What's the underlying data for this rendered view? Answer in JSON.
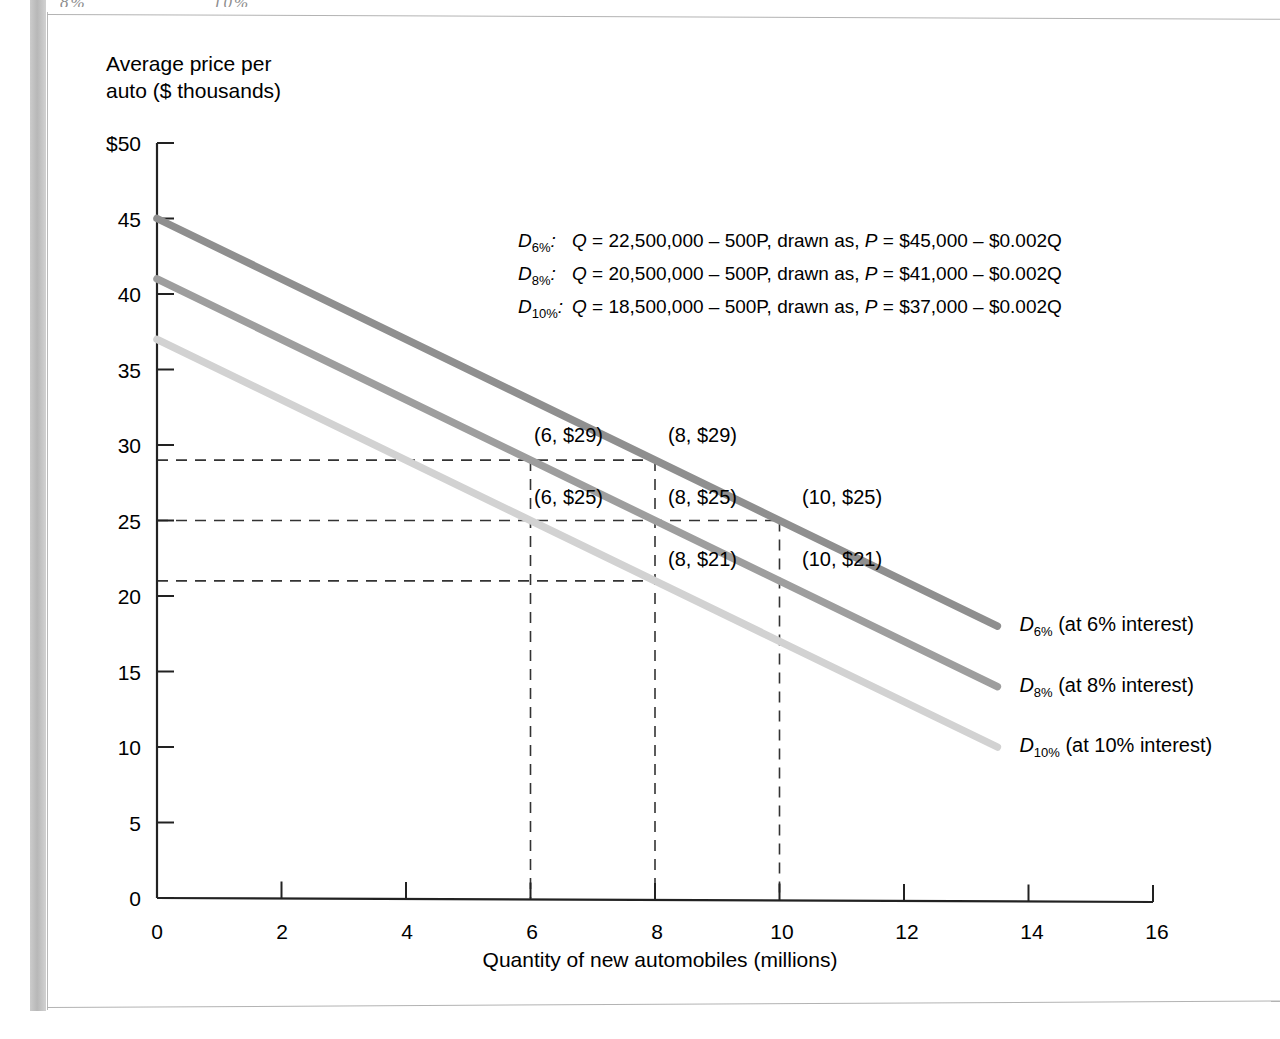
{
  "figure": {
    "y_axis_title": "Average price per\nauto ($ thousands)",
    "x_axis_title": "Quantity of new automobiles (millions)",
    "top_crop_fragments": [
      "8%",
      "10%"
    ]
  },
  "chart_data": {
    "type": "line",
    "title": "",
    "xlabel": "Quantity of new automobiles (millions)",
    "ylabel": "Average price per auto ($ thousands)",
    "xlim": [
      0,
      16
    ],
    "ylim": [
      0,
      50
    ],
    "xticks": [
      0,
      2,
      4,
      6,
      8,
      10,
      12,
      14,
      16
    ],
    "xtick_labels": [
      "0",
      "2",
      "4",
      "6",
      "8",
      "10",
      "12",
      "14",
      "16"
    ],
    "yticks": [
      0,
      5,
      10,
      15,
      20,
      25,
      30,
      35,
      40,
      45,
      50
    ],
    "ytick_labels": [
      "0",
      "5",
      "10",
      "15",
      "20",
      "25",
      "30",
      "35",
      "40",
      "45",
      "$50"
    ],
    "grid": false,
    "legend_position": "right-of-curve-ends",
    "series": [
      {
        "name": "D6%",
        "label": "D6% (at 6% interest)",
        "label_symbol": "D",
        "label_sub": "6%",
        "label_suffix": " (at 6% interest)",
        "color": "#8f8f8f",
        "intercept": 45,
        "slope": -2,
        "x": [
          0,
          13.5
        ],
        "y": [
          45,
          18
        ]
      },
      {
        "name": "D8%",
        "label": "D8% (at 8% interest)",
        "label_symbol": "D",
        "label_sub": "8%",
        "label_suffix": " (at 8% interest)",
        "color": "#9e9e9e",
        "intercept": 41,
        "slope": -2,
        "x": [
          0,
          13.5
        ],
        "y": [
          41,
          14
        ]
      },
      {
        "name": "D10%",
        "label": "D10% (at 10% interest)",
        "label_symbol": "D",
        "label_sub": "10%",
        "label_suffix": " (at 10% interest)",
        "color": "#d2d2d2",
        "intercept": 37,
        "slope": -2,
        "x": [
          0,
          13.5
        ],
        "y": [
          37,
          10
        ]
      }
    ],
    "equations": [
      {
        "curve": "D",
        "curve_sub": "6%",
        "text": "Q = 22,500,000 – 500P, drawn as, P = $45,000 – $0.002Q"
      },
      {
        "curve": "D",
        "curve_sub": "8%",
        "text": "Q = 20,500,000 – 500P, drawn as, P = $41,000 – $0.002Q"
      },
      {
        "curve": "D",
        "curve_sub": "10%",
        "text": "Q = 18,500,000 – 500P, drawn as, P = $37,000 – $0.002Q"
      }
    ],
    "annotated_points": [
      {
        "label": "(6, $29)",
        "q": 6,
        "p": 29,
        "lx": 534,
        "ly": 424
      },
      {
        "label": "(8, $29)",
        "q": 8,
        "p": 29,
        "lx": 668,
        "ly": 424
      },
      {
        "label": "(6, $25)",
        "q": 6,
        "p": 25,
        "lx": 534,
        "ly": 486
      },
      {
        "label": "(8, $25)",
        "q": 8,
        "p": 25,
        "lx": 668,
        "ly": 486
      },
      {
        "label": "(10, $25)",
        "q": 10,
        "p": 25,
        "lx": 802,
        "ly": 486
      },
      {
        "label": "(8, $21)",
        "q": 8,
        "p": 21,
        "lx": 668,
        "ly": 548
      },
      {
        "label": "(10, $21)",
        "q": 10,
        "p": 21,
        "lx": 802,
        "ly": 548
      }
    ],
    "guide_lines": {
      "horizontal_prices": [
        29,
        25,
        21
      ],
      "vertical_quantities": [
        6,
        8,
        10
      ]
    }
  }
}
